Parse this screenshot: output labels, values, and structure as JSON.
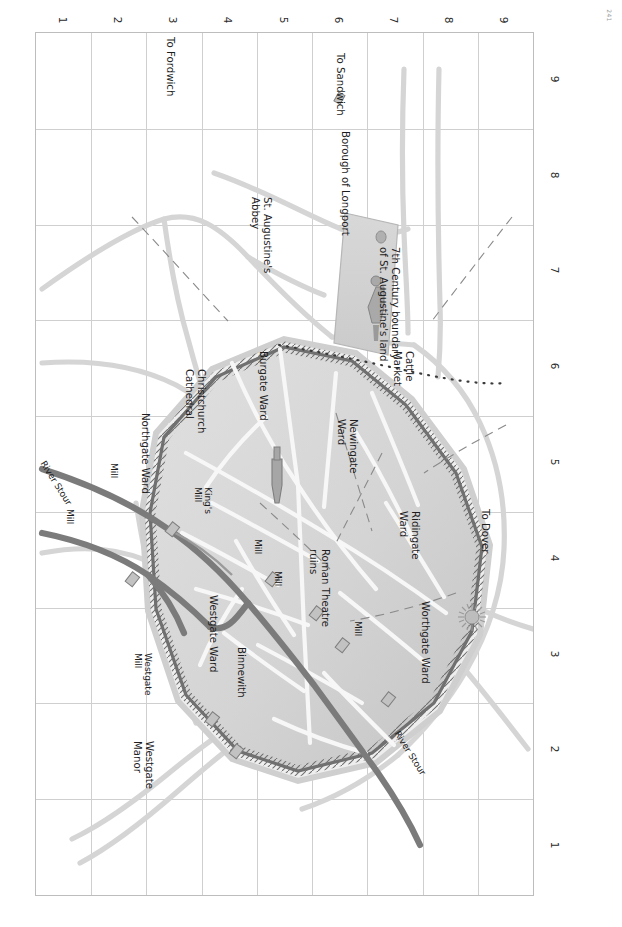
{
  "page": {
    "number": "241"
  },
  "title_block": {
    "title": "map 5",
    "subtitle": "circa 1050"
  },
  "grid": {
    "row_labels": [
      "1",
      "2",
      "3",
      "4",
      "5",
      "6",
      "7",
      "8",
      "9"
    ],
    "col_labels": [
      "1",
      "2",
      "3",
      "4",
      "5",
      "6",
      "7",
      "8",
      "9"
    ],
    "columns": 9,
    "rows": 9,
    "line_color": "#cfcfcf"
  },
  "colors": {
    "city_fill": "#d6d6d6",
    "abbey_fill": "#d0d0d0",
    "wall_dark": "#6e6e6e",
    "river_dark": "#777777",
    "road_light": "#d2d2d2",
    "street_white": "#f6f6f6",
    "grid": "#cfcfcf",
    "frame": "#bdbdbd",
    "text": "#1d1d1d"
  },
  "labels": {
    "roads": [
      {
        "id": "to-fordwich",
        "text": "To Fordwich"
      },
      {
        "id": "to-sandwich",
        "text": "To Sandwich"
      },
      {
        "id": "to-sturry-and-fordwich",
        "text": "To Sturry\nand Fordwich"
      },
      {
        "id": "to-hackington",
        "text": "To Hackington"
      },
      {
        "id": "to-blean",
        "text": "To Blean"
      },
      {
        "id": "to-london-and-rochester",
        "text": "To London\nand Rochester"
      },
      {
        "id": "to-dover",
        "text": "To Dover"
      }
    ],
    "wards": [
      {
        "id": "northgate-ward",
        "text": "Northgate Ward"
      },
      {
        "id": "westgate-ward",
        "text": "Westgate Ward"
      },
      {
        "id": "burgate-ward",
        "text": "Burgate Ward"
      },
      {
        "id": "newingate-ward",
        "text": "Newingate\nWard"
      },
      {
        "id": "ridingate-ward",
        "text": "Ridingate\nWard"
      },
      {
        "id": "worthgate-ward",
        "text": "Worthgate Ward"
      }
    ],
    "places": [
      {
        "id": "christchurch-cathedral",
        "text": "Christchurch\nCathedral"
      },
      {
        "id": "st-augustines-abbey",
        "text": "St. Augustine's\nAbbey"
      },
      {
        "id": "borough-of-longport",
        "text": "Borough of Longport"
      },
      {
        "id": "kingsmead",
        "text": "Kingsmead"
      },
      {
        "id": "binnewith",
        "text": "Binnewith"
      },
      {
        "id": "cattle-market",
        "text": "Cattle\nMarket"
      },
      {
        "id": "roman-theatre-ruins",
        "text": "Roman Theatre\nruins"
      },
      {
        "id": "westgate-manor",
        "text": "Westgate\nManor"
      }
    ],
    "mills": [
      {
        "id": "mill-north",
        "text": "Mill"
      },
      {
        "id": "mill-west",
        "text": "Mill"
      },
      {
        "id": "kings-mill",
        "text": "King's\nMill"
      },
      {
        "id": "mill-central",
        "text": "Mill"
      },
      {
        "id": "mill-east",
        "text": "Mill"
      },
      {
        "id": "mill-south",
        "text": "Mill"
      },
      {
        "id": "westgate-mill",
        "text": "Westgate\nMill"
      }
    ],
    "rivers": [
      {
        "id": "river-stour-north",
        "text": "River Stour"
      },
      {
        "id": "river-stour-south",
        "text": "River Stour"
      }
    ],
    "boundaries": [
      {
        "id": "seventh-century-boundary",
        "text": "7th Century boundary\nof St. Augustine's land"
      }
    ]
  }
}
